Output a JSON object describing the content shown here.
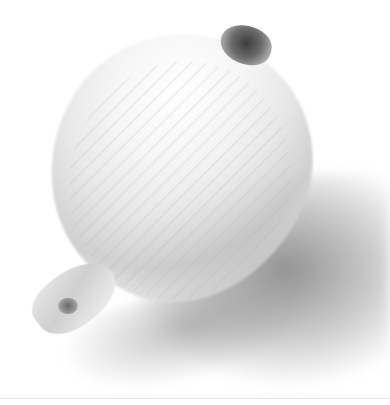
{
  "image": {
    "subject": "white onion",
    "background_color": "#ffffff",
    "tones": [
      "#ffffff",
      "#e9e9e9",
      "#bdbdbd",
      "#6b6b6b",
      "#3d3d3d"
    ]
  }
}
